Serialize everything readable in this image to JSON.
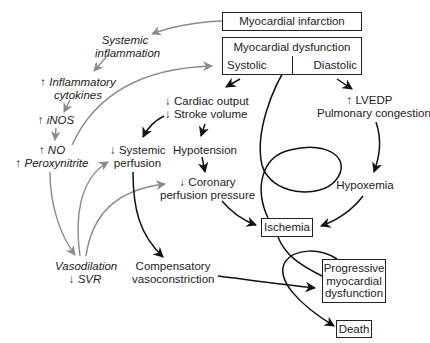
{
  "diagram": {
    "boxes": {
      "myocardial_infarction": "Myocardial infarction",
      "myocardial_dysfunction": "Myocardial dysfunction",
      "systolic": "Systolic",
      "diastolic": "Diastolic",
      "ischemia": "Ischemia",
      "progressive": [
        "Progressive",
        "myocardial",
        "dysfunction"
      ],
      "death": "Death"
    },
    "labels": {
      "systemic_inflammation": [
        "Systemic",
        "inflammation"
      ],
      "inflammatory_cytokines": [
        "↑ Inflammatory",
        "cytokines"
      ],
      "inos": "↑ iNOS",
      "no_peroxynitrite": [
        "↑ NO",
        "↑ Peroxynitrite"
      ],
      "cardiac_output": [
        "↓ Cardiac output",
        "↓ Stroke volume"
      ],
      "systemic_perfusion": [
        "↓ Systemic",
        "perfusion"
      ],
      "hypotension": "Hypotension",
      "coronary_perfusion": [
        "↓ Coronary",
        "perfusion pressure"
      ],
      "lvedp": [
        "↑ LVEDP",
        "Pulmonary congestion"
      ],
      "hypoxemia": "Hypoxemia",
      "vasodilation": [
        "Vasodilation",
        "↓ SVR"
      ],
      "compensatory": [
        "Compensatory",
        "vasoconstriction"
      ]
    },
    "colors": {
      "black_arrow": "#111111",
      "gray_arrow": "#8a8a8a",
      "box_border": "#222222"
    }
  }
}
